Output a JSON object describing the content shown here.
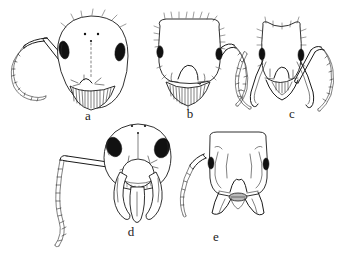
{
  "figure": {
    "kind": "scientific-line-drawing-plate",
    "background_color": "#ffffff",
    "ink_color": "#1a1a1a",
    "eye_color": "#111111",
    "mandible_membrane_color": "#b9b9b9",
    "panel_count": 5,
    "panels": [
      {
        "id": "a",
        "label": "a",
        "label_x": 88,
        "label_y": 120,
        "caste_note": "major worker, rounded head, left antenna extended, toothed mandibles",
        "head_shape": "broadly oval, widest above mid-length, narrowing to rounded clypeus",
        "eyes": 2,
        "ocelli": 3,
        "antennae_shown": 1,
        "antenna_side": "left",
        "antenna_segments": 11,
        "mandible_teeth": 12,
        "erect_hairs": true
      },
      {
        "id": "b",
        "label": "b",
        "label_x": 190,
        "label_y": 117,
        "caste_note": "worker, squarish head with dense marginal pilosity, right antenna extended",
        "head_shape": "sub-rectangular with rounded corners, straight posterior margin",
        "eyes": 2,
        "ocelli": 0,
        "antennae_shown": 1,
        "antenna_side": "right",
        "antenna_segments": 9,
        "mandible_teeth": 11,
        "erect_hairs": true
      },
      {
        "id": "c",
        "label": "c",
        "label_x": 292,
        "label_y": 118,
        "caste_note": "worker with concave posterior margin, two long curved antennae and sickle mandibles",
        "head_shape": "sub-rectangular, posterior margin deeply concave",
        "eyes": 2,
        "ocelli": 0,
        "antennae_shown": 2,
        "antenna_side": "both",
        "antenna_segments": 10,
        "mandible_teeth": 8,
        "erect_hairs": true
      },
      {
        "id": "d",
        "label": "d",
        "label_x": 131,
        "label_y": 235,
        "caste_note": "male or large-eyed form, very large eyes, long whip-like antenna, projecting clypeus and falcate mandibles",
        "head_shape": "broad oval, eyes occupying much of the sides",
        "eyes": 2,
        "ocelli": 3,
        "antennae_shown": 1,
        "antenna_side": "left",
        "antenna_segments": 16,
        "mandible_teeth": 10,
        "erect_hairs": false
      },
      {
        "id": "e",
        "label": "e",
        "label_x": 216,
        "label_y": 240,
        "caste_note": "worker with narrow elongate head, frontal carinae, small eyes and overlapping mandibles",
        "head_shape": "elongate sub-rectangular, sides nearly parallel",
        "eyes": 2,
        "ocelli": 0,
        "antennae_shown": 1,
        "antenna_side": "left",
        "antenna_segments": 9,
        "mandible_teeth": 0,
        "erect_hairs": false
      }
    ]
  }
}
